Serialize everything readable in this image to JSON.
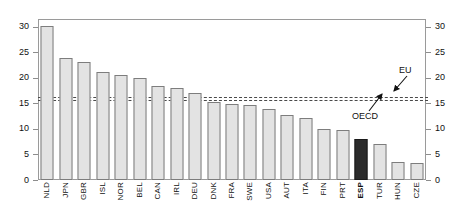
{
  "chart_data": {
    "type": "bar",
    "title": "",
    "xlabel": "",
    "ylabel": "",
    "ylim": [
      0,
      31.5
    ],
    "yticks": [
      0,
      5,
      10,
      15,
      20,
      25,
      30
    ],
    "ytick_labels": [
      "0",
      "5",
      "10",
      "15",
      "20",
      "25",
      "30"
    ],
    "grid": false,
    "dual_axis": true,
    "legend": "none",
    "categories": [
      "NLD",
      "JPN",
      "GBR",
      "ISL",
      "NOR",
      "BEL",
      "CAN",
      "IRL",
      "DEU",
      "DNK",
      "FRA",
      "SWE",
      "USA",
      "AUT",
      "ITA",
      "FIN",
      "PRT",
      "ESP",
      "TUR",
      "HUN",
      "CZE"
    ],
    "values": [
      30.2,
      23.9,
      23.0,
      21.1,
      20.5,
      19.9,
      18.3,
      18.1,
      17.0,
      15.2,
      14.8,
      14.6,
      13.8,
      12.7,
      12.2,
      10.0,
      9.8,
      8.0,
      7.0,
      3.5,
      3.4
    ],
    "highlight_category": "ESP",
    "bar_color": "#e3e3e3",
    "bar_edge_color": "#7d7d7d",
    "highlight_color": "#2b2b2b",
    "reference_lines": [
      {
        "label": "EU",
        "value": 16.3,
        "style": "dashed"
      },
      {
        "label": "OECD",
        "value": 15.7,
        "style": "dashed"
      }
    ],
    "annotations": [
      {
        "text": "EU",
        "target": "EU reference line"
      },
      {
        "text": "OECD",
        "target": "OECD reference line"
      }
    ]
  }
}
